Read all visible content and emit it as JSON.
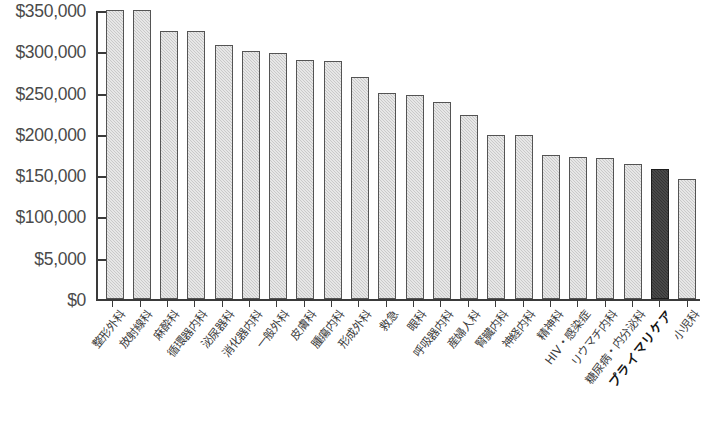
{
  "chart_data": {
    "type": "bar",
    "title": "",
    "xlabel": "",
    "ylabel": "",
    "ylim": [
      0,
      350000
    ],
    "grid": false,
    "legend": "none",
    "ytick_labels": [
      "$350,000",
      "$300,000",
      "$250,000",
      "$200,000",
      "$150,000",
      "$100,000",
      "$5,000",
      "$0"
    ],
    "ytick_values": [
      350000,
      300000,
      250000,
      200000,
      150000,
      100000,
      50000,
      0
    ],
    "highlight_category": "プライマリケア",
    "highlight_color": "#343434",
    "bar_color": "#c9c9c9",
    "categories": [
      "整形外科",
      "放射線科",
      "麻酔科",
      "循環器内科",
      "泌尿器科",
      "消化器内科",
      "一般外科",
      "皮膚科",
      "腫瘍内科",
      "形成外科",
      "救急",
      "眼科",
      "呼吸器内科",
      "産婦人科",
      "腎臓内科",
      "神経内科",
      "精神科",
      "HIV・感染症",
      "リウマチ内科",
      "糖尿病・内分泌科",
      "プライマリケア",
      "小児科"
    ],
    "values": [
      351000,
      350000,
      324000,
      324000,
      308000,
      300000,
      298000,
      290000,
      288000,
      269000,
      249000,
      247000,
      239000,
      223000,
      199000,
      199000,
      174000,
      172000,
      171000,
      163000,
      158000,
      145000
    ]
  },
  "footnote": ""
}
